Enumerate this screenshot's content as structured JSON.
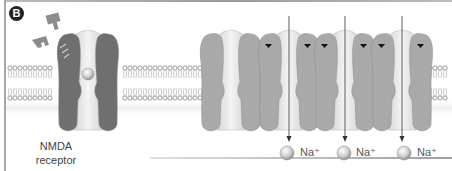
{
  "panel": {
    "letter": "B"
  },
  "labels": {
    "nmda_line1": "NMDA",
    "nmda_line2": "receptor"
  },
  "receptors": [
    {
      "name": "NMDA receptor",
      "state": "ligand-bound",
      "color": "#6f6f6f",
      "has_ion_in_pore": true
    },
    {
      "name": "AMPA receptor",
      "state": "closed",
      "color": "#a9a9a9",
      "has_arrow": false
    },
    {
      "name": "AMPA receptor",
      "state": "open",
      "color": "#a9a9a9",
      "has_arrow": true
    },
    {
      "name": "AMPA receptor",
      "state": "open",
      "color": "#a9a9a9",
      "has_arrow": true
    },
    {
      "name": "AMPA receptor",
      "state": "open",
      "color": "#a9a9a9",
      "has_arrow": true
    }
  ],
  "ions": [
    {
      "label": "Na⁺"
    },
    {
      "label": "Na⁺"
    },
    {
      "label": "Na⁺"
    }
  ],
  "colors": {
    "nmda_subunit": "#6f6f6f",
    "ampa_subunit": "#a9a9a9",
    "pore": "#e4e4e4",
    "membrane": "#9a9a9a",
    "ligand": "#8c8c8c"
  }
}
